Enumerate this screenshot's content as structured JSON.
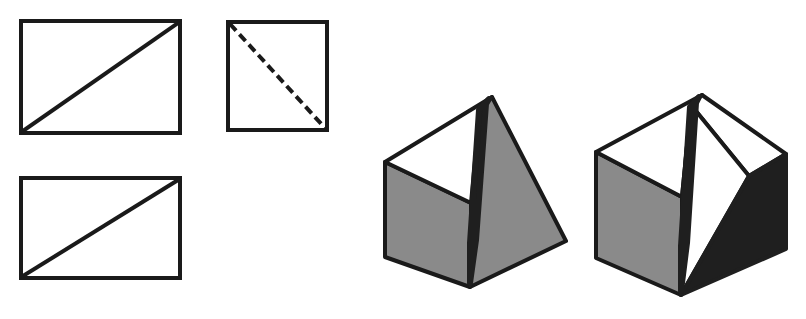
{
  "figure": {
    "background_color": "#ffffff",
    "stroke_color": "#1a1a1a",
    "gray_fill_color": "#8a8a8a",
    "dark_fill_color": "#1f1f1f",
    "white_fill_color": "#ffffff",
    "width": 806,
    "height": 319
  },
  "views": {
    "group_label": "orthographic-views",
    "items": [
      {
        "name": "front-view-rectangle",
        "shape": "rectangle",
        "diagonal_style": "solid",
        "diagonal_direction": "bottom-left-to-top-right",
        "x": 21,
        "y": 21,
        "width": 159,
        "height": 112,
        "stroke_width": 4
      },
      {
        "name": "top-view-square",
        "shape": "square",
        "diagonal_style": "dashed",
        "diagonal_direction": "top-left-to-bottom-right",
        "x": 228,
        "y": 22,
        "width": 99,
        "height": 108,
        "stroke_width": 4,
        "dash_pattern": "9 5"
      },
      {
        "name": "side-view-rectangle",
        "shape": "rectangle",
        "diagonal_style": "solid",
        "diagonal_direction": "bottom-left-to-top-right",
        "x": 21,
        "y": 178,
        "width": 159,
        "height": 100,
        "stroke_width": 4
      }
    ]
  },
  "solids": {
    "group_label": "pictorial-solids",
    "items": [
      {
        "name": "triangular-prism-wedge",
        "description": "triangular prism wedge with apex ridge",
        "faces": [
          {
            "name": "left-face",
            "fill": "gray"
          },
          {
            "name": "top-left-face",
            "fill": "white"
          },
          {
            "name": "right-inclined-face",
            "fill": "gray"
          },
          {
            "name": "ridge-face",
            "fill": "dark"
          }
        ],
        "vertices": {
          "apex_top": [
            492,
            97
          ],
          "left_top": [
            385,
            162
          ],
          "left_bottom": [
            385,
            257
          ],
          "mid_bottom": [
            470,
            287
          ],
          "right_bottom": [
            566,
            241
          ],
          "inner_ridge_top": [
            487,
            100
          ],
          "inner_ridge_bottom": [
            471,
            240
          ]
        }
      },
      {
        "name": "cut-cube-solid",
        "description": "cube with diagonal cut, dark triangular face on right",
        "faces": [
          {
            "name": "left-face",
            "fill": "gray"
          },
          {
            "name": "top-left-face",
            "fill": "white"
          },
          {
            "name": "top-right-face",
            "fill": "white"
          },
          {
            "name": "cut-face",
            "fill": "white"
          },
          {
            "name": "right-face",
            "fill": "dark"
          },
          {
            "name": "ridge-face",
            "fill": "dark"
          }
        ],
        "vertices": {
          "apex_top": [
            702,
            95
          ],
          "left_top": [
            596,
            152
          ],
          "left_bottom": [
            596,
            258
          ],
          "mid_bottom": [
            681,
            295
          ],
          "right_bottom": [
            786,
            249
          ],
          "right_top": [
            786,
            154
          ],
          "inner_ridge_top": [
            697,
            99
          ],
          "inner_ridge_bottom": [
            682,
            245
          ]
        }
      }
    ]
  }
}
